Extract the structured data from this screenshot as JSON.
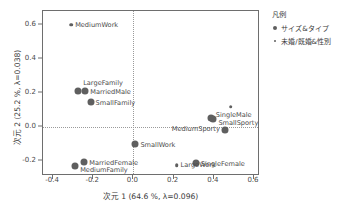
{
  "chart_data": {
    "type": "scatter",
    "title": "",
    "xlabel": "次元 1  (64.6 %, λ=0.096)",
    "ylabel": "次元 2  (25.2 %, λ=0.038)",
    "xlim": [
      -0.45,
      0.63
    ],
    "ylim": [
      -0.29,
      0.68
    ],
    "xticks": [
      "-0.4",
      "-0.2",
      "0.0",
      "0.2",
      "0.4",
      "0.6"
    ],
    "xtick_values": [
      -0.4,
      -0.2,
      0.0,
      0.2,
      0.4,
      0.6
    ],
    "yticks": [
      "0.6",
      "0.4",
      "0.2",
      "0.0",
      "-0.2"
    ],
    "ytick_values": [
      0.6,
      0.4,
      0.2,
      0.0,
      -0.2
    ],
    "grid": "dotted reference lines at x=0.0 and y=0.0",
    "legend_position": "right",
    "series": [
      {
        "name": "サイズ&タイプ",
        "marker": "big",
        "points": [
          {
            "label": "LargeFamily",
            "x": -0.275,
            "y": 0.21,
            "label_dx": 5,
            "label_dy": -8
          },
          {
            "label": "MarriedMale",
            "x": -0.24,
            "y": 0.208,
            "label_dx": 5,
            "label_dy": 1
          },
          {
            "label": "SmallFamily",
            "x": -0.213,
            "y": 0.145,
            "label_dx": 5,
            "label_dy": 1
          },
          {
            "label": "MediumFamily",
            "x": -0.29,
            "y": -0.232,
            "label_dx": 5,
            "label_dy": 4
          },
          {
            "label": "MarriedFemale",
            "x": -0.245,
            "y": -0.205,
            "label_dx": 5,
            "label_dy": 1
          },
          {
            "label": "SmallWork",
            "x": 0.01,
            "y": -0.1,
            "label_dx": 5,
            "label_dy": 1
          },
          {
            "label": "SingleMale",
            "x": 0.385,
            "y": 0.052,
            "label_dx": 5,
            "label_dy": -3
          },
          {
            "label": "SmallSporty",
            "x": 0.398,
            "y": 0.048,
            "label_dx": 5,
            "label_dy": 4
          },
          {
            "label": "MediumSporty",
            "x": 0.455,
            "y": -0.02,
            "label_dx": -5,
            "label_dy": -1,
            "anchor": "right"
          },
          {
            "label": "SingleFemale",
            "x": 0.31,
            "y": -0.215,
            "label_dx": 5,
            "label_dy": 1
          }
        ]
      },
      {
        "name": "未婚/既婚&性別",
        "marker": "small",
        "points": [
          {
            "label": "MediumWork",
            "x": -0.31,
            "y": 0.6,
            "label_dx": 4,
            "label_dy": 0
          },
          {
            "label": "",
            "x": 0.485,
            "y": 0.118,
            "label_dx": 4,
            "label_dy": 0
          },
          {
            "label": "LargeWork",
            "x": 0.215,
            "y": -0.226,
            "label_dx": 4,
            "label_dy": 0
          }
        ]
      }
    ]
  },
  "legend": {
    "title": "凡例",
    "items": [
      {
        "label": "サイズ&タイプ",
        "marker": "big"
      },
      {
        "label": "未婚/既婚&性別",
        "marker": "small"
      }
    ]
  },
  "axes": {
    "x_title": "次元 1  (64.6 %, λ=0.096)",
    "y_title": "次元 2  (25.2 %, λ=0.038)"
  },
  "colors": {
    "marker": "#5f5f5f",
    "frame": "#6e6e6e",
    "grid": "#9a9a9a",
    "text": "#3a3a3a"
  }
}
